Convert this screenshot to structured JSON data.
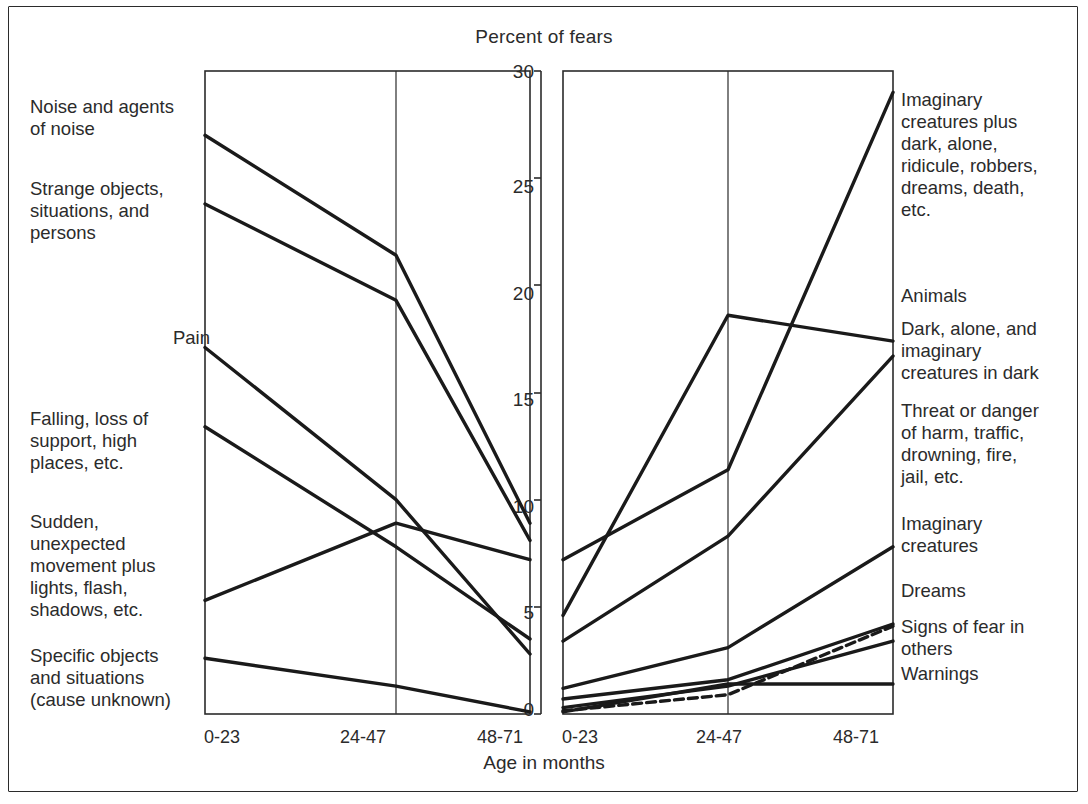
{
  "figure": {
    "title": "Percent of fears",
    "xlabel": "Age in months",
    "frame_color": "#2b2b2b"
  },
  "axis": {
    "yticks": [
      "30",
      "25",
      "20",
      "15",
      "10",
      "5",
      "0"
    ],
    "xticks_left": [
      "0-23",
      "24-47",
      "48-71"
    ],
    "xticks_right": [
      "0-23",
      "24-47",
      "48-71"
    ]
  },
  "left_labels": [
    "Noise and agents\nof noise",
    "Strange objects,\nsituations, and\npersons",
    "Pain",
    "Falling, loss of\nsupport, high\nplaces, etc.",
    "Sudden,\nunexpected\nmovement plus\nlights, flash,\nshadows, etc.",
    "Specific objects\nand situations\n(cause unknown)"
  ],
  "right_labels": [
    "Imaginary\ncreatures plus\ndark, alone,\nridicule, robbers,\ndreams, death,\netc.",
    "Animals",
    "Dark, alone, and\nimaginary\ncreatures in dark",
    "Threat or danger\nof harm, traffic,\ndrowning, fire,\njail, etc.",
    "Imaginary\ncreatures",
    "Dreams",
    "Signs of fear in\nothers",
    "Warnings"
  ],
  "chart_data": {
    "type": "line",
    "title": "Percent of fears",
    "xlabel": "Age in months",
    "ylabel": "Percent of fears",
    "ylim": [
      0,
      30
    ],
    "categories": [
      "0-23",
      "24-47",
      "48-71"
    ],
    "grid": false,
    "legend": "side-annotations",
    "panels": [
      {
        "name": "declining-fears",
        "position": "left",
        "series": [
          {
            "name": "Noise and agents of noise",
            "values": [
              27.0,
              21.4,
              8.9
            ],
            "style": "solid"
          },
          {
            "name": "Strange objects, situations, and persons",
            "values": [
              23.8,
              19.3,
              8.1
            ],
            "style": "solid"
          },
          {
            "name": "Pain",
            "values": [
              17.1,
              10.0,
              2.8
            ],
            "style": "solid"
          },
          {
            "name": "Falling, loss of support, high places, etc.",
            "values": [
              13.4,
              7.8,
              3.5
            ],
            "style": "solid"
          },
          {
            "name": "Sudden, unexpected movement plus lights, flash, shadows, etc.",
            "values": [
              5.3,
              8.9,
              7.2
            ],
            "style": "solid"
          },
          {
            "name": "Specific objects and situations (cause unknown)",
            "values": [
              2.6,
              1.3,
              0.1
            ],
            "style": "solid"
          }
        ]
      },
      {
        "name": "increasing-fears",
        "position": "right",
        "series": [
          {
            "name": "Imaginary creatures plus dark, alone, ridicule, robbers, dreams, death, etc.",
            "values": [
              7.2,
              11.4,
              29.0
            ],
            "style": "solid"
          },
          {
            "name": "Animals",
            "values": [
              4.6,
              18.6,
              17.4
            ],
            "style": "solid"
          },
          {
            "name": "Dark, alone, and imaginary creatures in dark",
            "values": [
              3.4,
              8.3,
              16.7
            ],
            "style": "solid"
          },
          {
            "name": "Threat or danger of harm, traffic, drowning, fire, jail, etc.",
            "values": [
              1.2,
              3.1,
              7.8
            ],
            "style": "solid"
          },
          {
            "name": "Imaginary creatures",
            "values": [
              0.7,
              1.6,
              4.2
            ],
            "style": "solid"
          },
          {
            "name": "Dreams",
            "values": [
              0.3,
              1.3,
              3.4
            ],
            "style": "solid"
          },
          {
            "name": "Signs of fear in others",
            "values": [
              0.15,
              0.9,
              4.1
            ],
            "style": "dashed"
          },
          {
            "name": "Warnings",
            "values": [
              0.1,
              1.4,
              1.4
            ],
            "style": "solid"
          }
        ]
      }
    ]
  }
}
